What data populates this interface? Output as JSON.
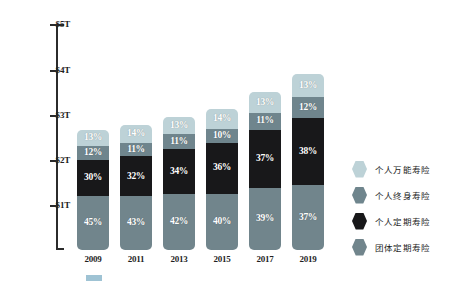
{
  "chart_data": {
    "type": "bar",
    "title": "",
    "subtitle": "",
    "xlabel": "",
    "ylabel": "",
    "stacked": true,
    "grid": false,
    "legend_position": "right",
    "categories": [
      "2009",
      "2011",
      "2013",
      "2015",
      "2017",
      "2019"
    ],
    "yticks": [
      "$1T",
      "$2T",
      "$3T",
      "$4T",
      "$5T"
    ],
    "ytick_values": [
      1,
      2,
      3,
      4,
      5
    ],
    "ylim": [
      0,
      5.5
    ],
    "y_unit": "T",
    "totals": [
      2.87,
      2.99,
      3.19,
      3.37,
      3.78,
      4.2
    ],
    "series": [
      {
        "name": "个人万能寿险",
        "color": "#bdd2d7",
        "values": [
          13,
          14,
          13,
          14,
          13,
          13
        ],
        "labels": [
          "13%",
          "14%",
          "13%",
          "14%",
          "13%",
          "13%"
        ]
      },
      {
        "name": "个人终身寿险",
        "color": "#6f858d",
        "values": [
          12,
          11,
          11,
          10,
          11,
          12
        ],
        "labels": [
          "12%",
          "11%",
          "11%",
          "10%",
          "11%",
          "12%"
        ]
      },
      {
        "name": "个人定期寿险",
        "color": "#18181a",
        "values": [
          30,
          32,
          34,
          36,
          37,
          38
        ],
        "labels": [
          "30%",
          "32%",
          "34%",
          "36%",
          "37%",
          "38%"
        ]
      },
      {
        "name": "团体定期寿险",
        "color": "#71858c",
        "values": [
          45,
          43,
          42,
          40,
          39,
          37
        ],
        "labels": [
          "45%",
          "43%",
          "42%",
          "40%",
          "39%",
          "37%"
        ]
      }
    ]
  },
  "legend": {
    "items": [
      {
        "label": "个人万能寿险",
        "color": "#bdd2d7"
      },
      {
        "label": "个人终身寿险",
        "color": "#6f858d"
      },
      {
        "label": "个人定期寿险",
        "color": "#18181a"
      },
      {
        "label": "团体定期寿险",
        "color": "#71858c"
      }
    ]
  },
  "axis": {
    "tick_labels": [
      "$5T",
      "$4T",
      "$3T",
      "$2T",
      "$1T"
    ]
  },
  "caption": {
    "text": ""
  }
}
